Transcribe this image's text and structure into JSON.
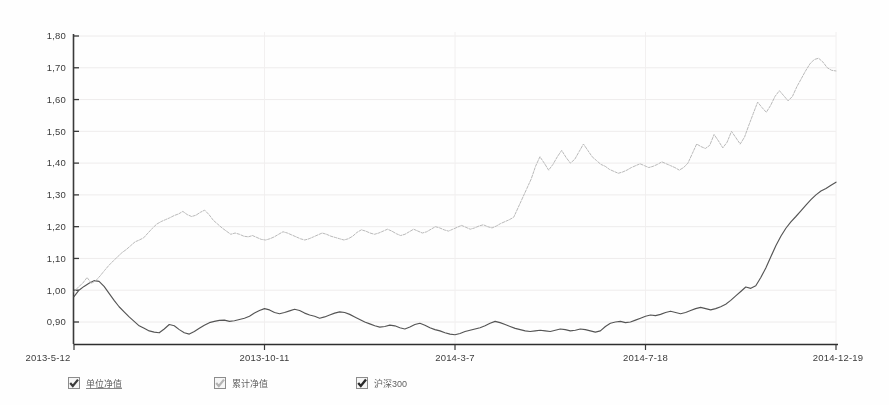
{
  "chart_data": {
    "type": "line",
    "title": "",
    "xlabel": "",
    "ylabel": "",
    "ylim": [
      0.85,
      1.8
    ],
    "yticks": [
      "0,90",
      "1,00",
      "1,10",
      "1,20",
      "1,30",
      "1,40",
      "1,50",
      "1,60",
      "1,70",
      "1,80"
    ],
    "ytick_values": [
      0.9,
      1.0,
      1.1,
      1.2,
      1.3,
      1.4,
      1.5,
      1.6,
      1.7,
      1.8
    ],
    "xticks": [
      "2013-5-12",
      "2013-10-11",
      "2014-3-7",
      "2014-7-18",
      "2014-12-19"
    ],
    "xtick_positions": [
      0,
      0.25,
      0.5,
      0.75,
      1.0
    ],
    "grid": true,
    "legend_position": "bottom",
    "series": [
      {
        "name": "单位净值",
        "color": "#555555",
        "style": "solid",
        "visible": true,
        "values": [
          0.98,
          1.0,
          1.012,
          1.022,
          1.03,
          1.028,
          1.012,
          0.99,
          0.968,
          0.948,
          0.932,
          0.916,
          0.902,
          0.888,
          0.88,
          0.872,
          0.868,
          0.866,
          0.878,
          0.892,
          0.888,
          0.876,
          0.866,
          0.862,
          0.87,
          0.88,
          0.89,
          0.898,
          0.902,
          0.905,
          0.906,
          0.902,
          0.904,
          0.908,
          0.912,
          0.918,
          0.928,
          0.936,
          0.942,
          0.938,
          0.93,
          0.926,
          0.93,
          0.935,
          0.94,
          0.936,
          0.928,
          0.922,
          0.918,
          0.912,
          0.916,
          0.922,
          0.928,
          0.932,
          0.93,
          0.924,
          0.916,
          0.908,
          0.9,
          0.894,
          0.888,
          0.884,
          0.886,
          0.89,
          0.888,
          0.882,
          0.878,
          0.884,
          0.892,
          0.896,
          0.89,
          0.882,
          0.876,
          0.872,
          0.866,
          0.862,
          0.86,
          0.864,
          0.87,
          0.874,
          0.878,
          0.882,
          0.888,
          0.896,
          0.902,
          0.898,
          0.892,
          0.886,
          0.88,
          0.876,
          0.872,
          0.87,
          0.872,
          0.874,
          0.872,
          0.87,
          0.874,
          0.878,
          0.876,
          0.872,
          0.874,
          0.878,
          0.876,
          0.872,
          0.868,
          0.872,
          0.886,
          0.896,
          0.9,
          0.902,
          0.898,
          0.9,
          0.906,
          0.912,
          0.918,
          0.922,
          0.92,
          0.924,
          0.93,
          0.934,
          0.93,
          0.926,
          0.93,
          0.936,
          0.942,
          0.946,
          0.942,
          0.938,
          0.942,
          0.948,
          0.956,
          0.968,
          0.982,
          0.996,
          1.01,
          1.006,
          1.014,
          1.04,
          1.07,
          1.105,
          1.14,
          1.17,
          1.195,
          1.215,
          1.232,
          1.25,
          1.268,
          1.285,
          1.3,
          1.312,
          1.32,
          1.33,
          1.34
        ]
      },
      {
        "name": "累计净值",
        "color": "#b9b9b9",
        "style": "dotted",
        "visible": true,
        "values": [
          0.995,
          1.01,
          1.022,
          1.04,
          1.022,
          1.03,
          1.045,
          1.062,
          1.078,
          1.092,
          1.105,
          1.118,
          1.128,
          1.14,
          1.152,
          1.158,
          1.165,
          1.18,
          1.195,
          1.208,
          1.216,
          1.222,
          1.228,
          1.235,
          1.24,
          1.248,
          1.238,
          1.232,
          1.236,
          1.245,
          1.252,
          1.238,
          1.22,
          1.208,
          1.196,
          1.186,
          1.176,
          1.18,
          1.176,
          1.17,
          1.168,
          1.172,
          1.166,
          1.16,
          1.158,
          1.162,
          1.168,
          1.176,
          1.184,
          1.18,
          1.174,
          1.168,
          1.162,
          1.158,
          1.162,
          1.168,
          1.174,
          1.18,
          1.176,
          1.17,
          1.166,
          1.162,
          1.158,
          1.162,
          1.17,
          1.182,
          1.19,
          1.186,
          1.18,
          1.176,
          1.18,
          1.186,
          1.192,
          1.186,
          1.178,
          1.172,
          1.176,
          1.184,
          1.192,
          1.186,
          1.18,
          1.184,
          1.192,
          1.2,
          1.196,
          1.19,
          1.186,
          1.192,
          1.198,
          1.204,
          1.198,
          1.192,
          1.196,
          1.202,
          1.206,
          1.2,
          1.196,
          1.202,
          1.21,
          1.216,
          1.222,
          1.23,
          1.26,
          1.29,
          1.32,
          1.35,
          1.39,
          1.42,
          1.4,
          1.378,
          1.396,
          1.42,
          1.44,
          1.418,
          1.4,
          1.412,
          1.436,
          1.46,
          1.44,
          1.42,
          1.408,
          1.396,
          1.39,
          1.38,
          1.374,
          1.368,
          1.372,
          1.378,
          1.386,
          1.392,
          1.398,
          1.392,
          1.386,
          1.39,
          1.396,
          1.404,
          1.398,
          1.392,
          1.386,
          1.378,
          1.386,
          1.4,
          1.43,
          1.46,
          1.452,
          1.446,
          1.456,
          1.49,
          1.47,
          1.448,
          1.466,
          1.5,
          1.48,
          1.46,
          1.482,
          1.52,
          1.556,
          1.592,
          1.575,
          1.56,
          1.582,
          1.61,
          1.628,
          1.612,
          1.596,
          1.61,
          1.64,
          1.665,
          1.69,
          1.712,
          1.726,
          1.73,
          1.718,
          1.7,
          1.692,
          1.69
        ]
      },
      {
        "name": "沪深300",
        "color": "#777777",
        "style": "solid",
        "visible": true,
        "values": []
      }
    ]
  },
  "legend": {
    "items": [
      {
        "label": "单位净值",
        "checked": true,
        "swatch": "#4a4a4a"
      },
      {
        "label": "累计净值",
        "checked": true,
        "swatch": "#b0b0b0"
      },
      {
        "label": "沪深300",
        "checked": true,
        "swatch": "#3a3a3a"
      }
    ]
  }
}
